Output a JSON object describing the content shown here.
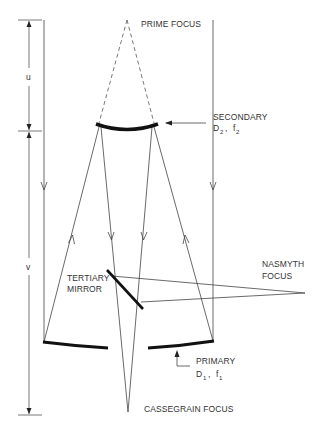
{
  "diagram": {
    "colors": {
      "line": "#444444",
      "mirror": "#111111",
      "text": "#333333",
      "background": "#ffffff"
    },
    "labels": {
      "prime_focus": "PRIME FOCUS",
      "secondary": "SECONDARY",
      "secondary_D": "D",
      "secondary_D_sub": "2",
      "secondary_f": "f",
      "secondary_f_sub": "2",
      "secondary_sep": ",",
      "tertiary_line1": "TERTIARY",
      "tertiary_line2": "MIRROR",
      "nasmyth_line1": "NASMYTH",
      "nasmyth_line2": "FOCUS",
      "primary": "PRIMARY",
      "primary_D": "D",
      "primary_D_sub": "1",
      "primary_f": "f",
      "primary_f_sub": "1",
      "primary_sep": ",",
      "cassegrain_focus": "CASSEGRAIN FOCUS",
      "dim_u": "u",
      "dim_v": "v"
    }
  }
}
